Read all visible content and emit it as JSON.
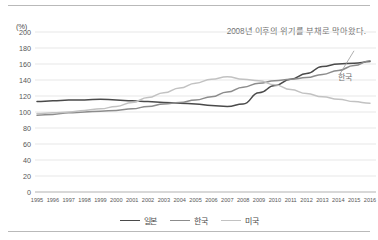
{
  "chart_data": {
    "type": "line",
    "title": "",
    "subtitle": "",
    "annotation": "2008년 이후의 위기를 부채로 막아왔다.",
    "unit_label": "(%)",
    "xlabel": "",
    "ylabel": "",
    "ylim": [
      0,
      200
    ],
    "ytick_step": 20,
    "yticks": [
      0,
      20,
      40,
      60,
      80,
      100,
      120,
      140,
      160,
      180,
      200
    ],
    "grid": true,
    "grid_axis": "y",
    "legend_position": "bottom-center",
    "categories": [
      1995,
      1996,
      1997,
      1998,
      1999,
      2000,
      2001,
      2002,
      2003,
      2004,
      2005,
      2006,
      2007,
      2008,
      2009,
      2010,
      2011,
      2012,
      2013,
      2014,
      2015,
      2016
    ],
    "xtick_labels": [
      "1995",
      "1996",
      "1997",
      "1998",
      "1999",
      "2000",
      "2001",
      "2002",
      "2003",
      "2004",
      "2005",
      "2006",
      "2007",
      "2008",
      "2009",
      "2010",
      "2011",
      "2012",
      "2013",
      "2014",
      "2015",
      "2016"
    ],
    "series": [
      {
        "name": "일본",
        "color": "#4a4a4a",
        "values": [
          113,
          114,
          115,
          115,
          116,
          115,
          114,
          113,
          112,
          111,
          110,
          108,
          107,
          110,
          124,
          133,
          141,
          148,
          157,
          160,
          161,
          163
        ]
      },
      {
        "name": "한국",
        "color": "#8c8c8c",
        "values": [
          96,
          97,
          99,
          100,
          101,
          102,
          104,
          107,
          110,
          112,
          115,
          119,
          125,
          131,
          136,
          139,
          141,
          143,
          147,
          152,
          158,
          164
        ]
      },
      {
        "name": "미국",
        "color": "#c2c2c2",
        "values": [
          98,
          99,
          100,
          102,
          104,
          107,
          112,
          118,
          124,
          130,
          136,
          141,
          144,
          141,
          139,
          134,
          128,
          123,
          119,
          116,
          113,
          111
        ]
      }
    ],
    "callouts": [
      {
        "label": "한국",
        "series": "한국",
        "at_x": 2016
      }
    ]
  }
}
